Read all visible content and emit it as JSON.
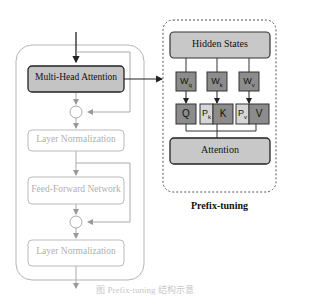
{
  "transformer_block": {
    "multi_head_attention": "Multi-Head Attention",
    "layer_norm_1": "Layer Normalization",
    "feed_forward": "Feed-Forward Network",
    "layer_norm_2": "Layer Normalization",
    "add_symbol": "+"
  },
  "prefix_panel": {
    "hidden_states": "Hidden States",
    "weights": [
      {
        "main": "W",
        "sub": "q"
      },
      {
        "main": "W",
        "sub": "k"
      },
      {
        "main": "W",
        "sub": "v"
      }
    ],
    "q": "Q",
    "pk": {
      "main": "P",
      "sub": "k"
    },
    "k": "K",
    "pv": {
      "main": "P",
      "sub": "v"
    },
    "v": "V",
    "attention": "Attention",
    "title": "Prefix-tuning"
  },
  "caption": "图 Prefix-tuning 结构示意",
  "colors": {
    "dark_box": "#8c8c8c",
    "light_box": "#d6d6d6",
    "panel_fill": "#c8c8c8",
    "faded_line": "#aaaaaa",
    "faded_text": "#b0b0b0"
  }
}
